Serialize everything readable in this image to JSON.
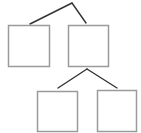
{
  "diagram": {
    "type": "tree",
    "canvas": {
      "width": 141,
      "height": 133,
      "background": "#ffffff"
    },
    "colors": {
      "box_stroke": "#9a9a9a",
      "box_fill": "#ffffff",
      "edge_stroke": "#333333"
    },
    "nodes": [
      {
        "id": "root",
        "label": "",
        "x": 72,
        "y": 3,
        "visible": false
      },
      {
        "id": "box-1",
        "label": "",
        "x": 8,
        "y": 25,
        "w": 41,
        "h": 41
      },
      {
        "id": "box-2",
        "label": "",
        "x": 68,
        "y": 25,
        "w": 40,
        "h": 41
      },
      {
        "id": "box-3",
        "label": "",
        "x": 37,
        "y": 91,
        "w": 40,
        "h": 40
      },
      {
        "id": "box-4",
        "label": "",
        "x": 97,
        "y": 90,
        "w": 39,
        "h": 41
      }
    ],
    "edges": [
      {
        "from": "root",
        "to": "box-1",
        "x1": 72,
        "y1": 3,
        "x2": 30,
        "y2": 24
      },
      {
        "from": "root",
        "to": "box-2",
        "x1": 72,
        "y1": 3,
        "x2": 86,
        "y2": 23
      },
      {
        "from": "box-2",
        "to": "box-3",
        "x1": 87,
        "y1": 69,
        "x2": 58,
        "y2": 88
      },
      {
        "from": "box-2",
        "to": "box-4",
        "x1": 87,
        "y1": 69,
        "x2": 117,
        "y2": 88
      }
    ]
  }
}
